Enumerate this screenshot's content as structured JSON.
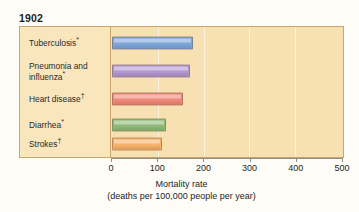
{
  "title": "1902",
  "chart_data": {
    "type": "bar",
    "orientation": "horizontal",
    "title": "1902",
    "xlabel": "Mortality rate",
    "xsublabel": "(deaths per 100,000 people per year)",
    "ylabel": "",
    "xlim": [
      0,
      500
    ],
    "xticks": [
      0,
      100,
      200,
      300,
      400,
      500
    ],
    "xtick_labels": [
      "0",
      "100",
      "200",
      "300",
      "400",
      "500"
    ],
    "grid": true,
    "grid_axis": "x",
    "legend": "none",
    "categories": [
      "Tuberculosis*",
      "Pneumonia and influenza*",
      "Heart disease†",
      "Diarrhea*",
      "Strokes†"
    ],
    "values": [
      175,
      168,
      153,
      116,
      109
    ],
    "bars": [
      {
        "label": "Tuberculosis",
        "marker": "*",
        "value": 175,
        "color": "#7da5da"
      },
      {
        "label": "Pneumonia and influenza",
        "marker": "*",
        "value": 168,
        "color": "#b196cf"
      },
      {
        "label": "Heart disease",
        "marker": "†",
        "value": 153,
        "color": "#f0877a"
      },
      {
        "label": "Diarrhea",
        "marker": "*",
        "value": 116,
        "color": "#8fba78"
      },
      {
        "label": "Strokes",
        "marker": "†",
        "value": 109,
        "color": "#f6b16a"
      }
    ]
  },
  "colors": {
    "panel_background": "#f8e2b5",
    "label_panel_background": "#f9e6bd",
    "plot_background": "#f7e0b1",
    "border": "#c6a86c",
    "axis": "#8c8c8c",
    "text": "#1f1f1f"
  }
}
